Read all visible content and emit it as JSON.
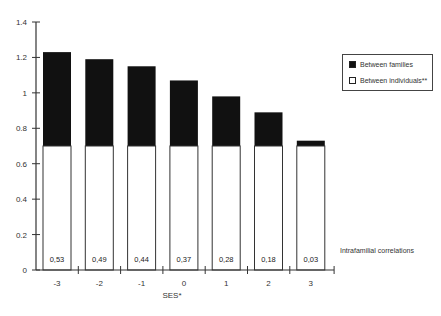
{
  "chart_data": {
    "type": "bar",
    "stacked": true,
    "title": "",
    "xlabel": "SES*",
    "ylabel": "",
    "ylim": [
      0,
      1.4
    ],
    "yticks": [
      "0",
      "0.2",
      "0.4",
      "0.6",
      "0.8",
      "1",
      "1.2",
      "1.4"
    ],
    "categories": [
      "-3",
      "-2",
      "-1",
      "0",
      "1",
      "2",
      "3"
    ],
    "series": [
      {
        "name": "Between individuals**",
        "color": "#ffffff",
        "values": [
          0.7,
          0.7,
          0.7,
          0.7,
          0.7,
          0.7,
          0.7
        ]
      },
      {
        "name": "Between families",
        "color": "#111111",
        "values": [
          0.53,
          0.49,
          0.45,
          0.37,
          0.28,
          0.19,
          0.03
        ]
      }
    ],
    "totals": [
      1.23,
      1.19,
      1.15,
      1.07,
      0.98,
      0.89,
      0.73
    ],
    "data_labels": [
      "0,53",
      "0,49",
      "0,44",
      "0,37",
      "0,28",
      "0,18",
      "0,03"
    ],
    "annotation": "Intrafamilial correlations",
    "legend_position": "right",
    "grid": false
  },
  "legend": {
    "items": [
      {
        "label": "Between families",
        "color": "#111111"
      },
      {
        "label": "Between individuals**",
        "color": "#ffffff"
      }
    ]
  }
}
